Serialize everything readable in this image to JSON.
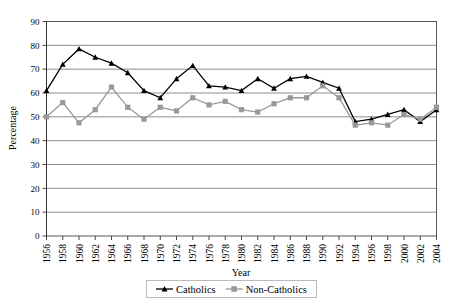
{
  "chart_data": {
    "type": "line",
    "title": "",
    "xlabel": "Year",
    "ylabel": "Percentage",
    "ylim": [
      0,
      90
    ],
    "ytick_step": 10,
    "yticks": [
      0,
      10,
      20,
      30,
      40,
      50,
      60,
      70,
      80,
      90
    ],
    "grid": true,
    "legend_position": "bottom",
    "categories": [
      "1956",
      "1958",
      "1960",
      "1962",
      "1964",
      "1966",
      "1968",
      "1970",
      "1972",
      "1974",
      "1976",
      "1978",
      "1980",
      "1982",
      "1984",
      "1986",
      "1988",
      "1990",
      "1992",
      "1994",
      "1996",
      "1998",
      "2000",
      "2002",
      "2004"
    ],
    "series": [
      {
        "name": "Catholics",
        "color": "#000000",
        "marker": "triangle",
        "values": [
          61,
          72,
          78.5,
          75,
          72.5,
          68.5,
          61,
          58,
          66,
          71.5,
          63,
          62.5,
          61,
          66,
          62,
          66,
          67,
          64.5,
          62,
          48,
          49,
          51,
          53,
          48,
          53
        ]
      },
      {
        "name": "Non-Catholics",
        "color": "#999999",
        "marker": "square",
        "values": [
          50,
          56,
          47.5,
          53,
          62.5,
          54,
          49,
          54,
          52.5,
          58,
          55,
          56.5,
          53,
          52,
          55.5,
          58,
          58,
          63,
          58,
          46.5,
          47.5,
          46.5,
          51,
          49,
          54
        ]
      }
    ]
  },
  "legend": {
    "items": [
      {
        "label": "Catholics"
      },
      {
        "label": "Non-Catholics"
      }
    ]
  }
}
